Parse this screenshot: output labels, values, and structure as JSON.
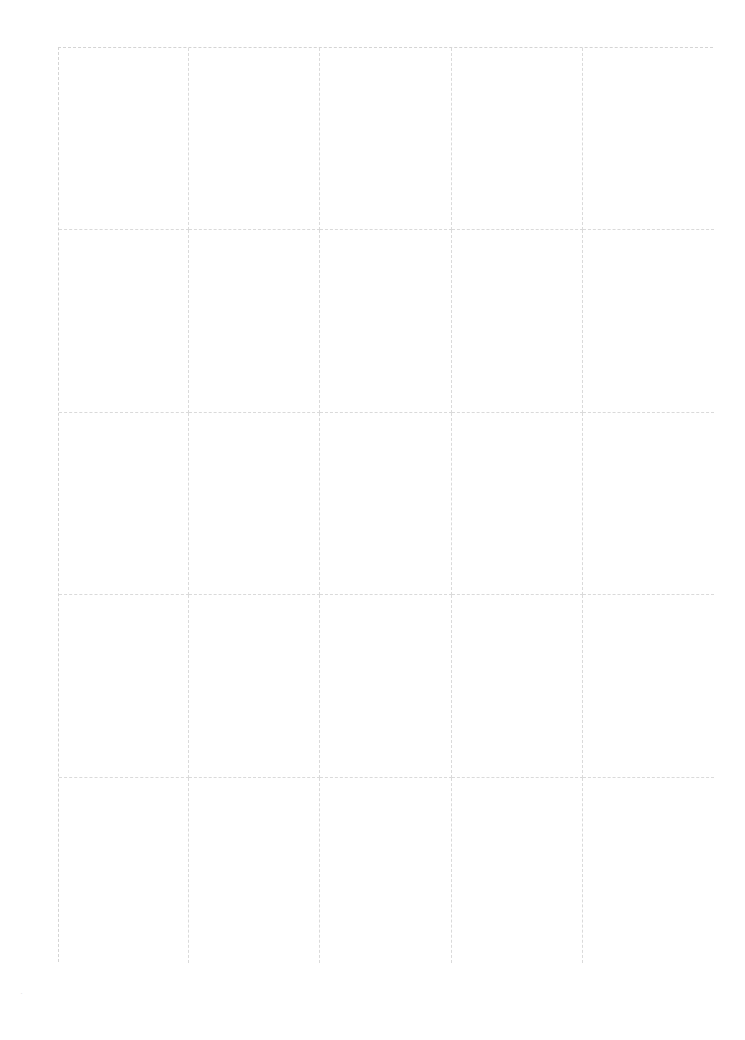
{
  "page": {
    "background": "#ffffff",
    "grid_line_color": "#d4d4d4",
    "grid": {
      "rows": 5,
      "columns": 5,
      "cells": [
        [
          "",
          "",
          "",
          "",
          ""
        ],
        [
          "",
          "",
          "",
          "",
          ""
        ],
        [
          "",
          "",
          "",
          "",
          ""
        ],
        [
          "",
          "",
          "",
          "",
          ""
        ],
        [
          "",
          "",
          "",
          "",
          ""
        ]
      ]
    },
    "footer_mark": "·"
  }
}
